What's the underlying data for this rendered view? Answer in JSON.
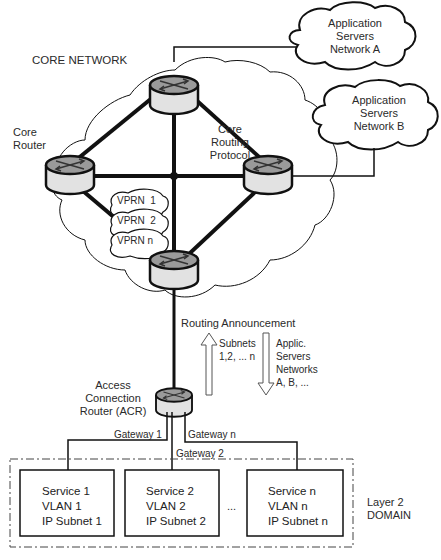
{
  "title": "CORE NETWORK",
  "labels": {
    "core_router": "Core\nRouter",
    "core_routing_protocol": "Core\nRouting\nProtocol",
    "routing_announcement": "Routing Announcement",
    "subnets": "Subnets\n1,2, ... n",
    "applic": "Applic.\nServers\nNetworks\nA, B, ...",
    "acr": "Access\nConnection\nRouter (ACR)",
    "gateway1": "Gateway 1",
    "gateway2": "Gateway 2",
    "gatewayn": "Gateway n",
    "layer2": "Layer 2\nDOMAIN",
    "ellipsis": "..."
  },
  "clouds": {
    "net_a": "Application\nServers\nNetwork A",
    "net_b": "Application\nServers\nNetwork B"
  },
  "vprns": [
    "VPRN  1",
    "VPRN  2",
    "VPRN n"
  ],
  "services": [
    {
      "service": "Service 1",
      "vlan": "VLAN 1",
      "subnet": "IP Subnet 1"
    },
    {
      "service": "Service 2",
      "vlan": "VLAN 2",
      "subnet": "IP Subnet 2"
    },
    {
      "service": "Service n",
      "vlan": "VLAN n",
      "subnet": "IP Subnet n"
    }
  ],
  "colors": {
    "router_top": "#9a9a9a",
    "router_side": "#e2e2e2",
    "line": "#111111"
  }
}
